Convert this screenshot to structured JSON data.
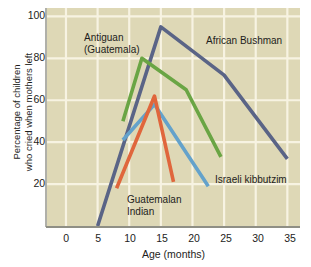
{
  "chart_data": {
    "type": "line",
    "title": "",
    "xlabel": "Age (months)",
    "ylabel": "Percentage of children who cried when mothers left",
    "ylabel_line1": "Percentage of children",
    "ylabel_line2": "who cried when mothers left",
    "xlim": [
      -3,
      37
    ],
    "ylim": [
      0,
      104
    ],
    "xticks": [
      0,
      5,
      10,
      15,
      20,
      25,
      30,
      35
    ],
    "yticks": [
      20,
      40,
      60,
      80,
      100
    ],
    "xtick_labels": [
      "0",
      "5",
      "10",
      "15",
      "20",
      "25",
      "30",
      "35"
    ],
    "ytick_labels": [
      "20",
      "40",
      "60",
      "80",
      "100"
    ],
    "grid": true,
    "grid_color": "#f7f3e2",
    "plot_background": "#ded8b6",
    "legend_position": "inline-annotations",
    "series": [
      {
        "name": "African Bushman",
        "color": "#5a6486",
        "label_line1": "African Bushman",
        "label_line2": "",
        "x": [
          5,
          15,
          25,
          35
        ],
        "y": [
          0,
          95,
          72,
          32
        ]
      },
      {
        "name": "Antiguan (Guatemala)",
        "color": "#6aa544",
        "label_line1": "Antiguan",
        "label_line2": "(Guatemala)",
        "x": [
          9,
          12,
          19,
          24.5
        ],
        "y": [
          50,
          80,
          65,
          33
        ]
      },
      {
        "name": "Israeli kibbutzim",
        "color": "#64a2cb",
        "label_line1": "Israeli kibbutzim",
        "label_line2": "",
        "x": [
          9,
          14,
          22.5
        ],
        "y": [
          41,
          58,
          19
        ]
      },
      {
        "name": "Guatemalan Indian",
        "color": "#e0663c",
        "label_line1": "Guatemalan",
        "label_line2": "Indian",
        "x": [
          8,
          14,
          17
        ],
        "y": [
          18,
          62,
          21
        ]
      }
    ]
  }
}
